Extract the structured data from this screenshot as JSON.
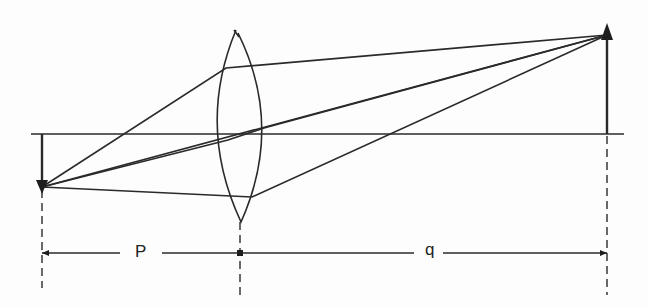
{
  "diagram": {
    "type": "thin convex lens ray diagram",
    "colors": {
      "line": "#2a2a2a",
      "background": "#fdfdfd"
    },
    "optical_axis": {
      "x1": 31,
      "x2": 624,
      "y": 134
    },
    "lens": {
      "center_x": 238,
      "top_y": 30,
      "bottom_y": 222,
      "left_x": 214,
      "right_x": 264
    },
    "object": {
      "x": 42,
      "base_y": 134,
      "tip_y": 187,
      "direction": "down"
    },
    "image": {
      "x": 607,
      "base_y": 134,
      "tip_y": 28,
      "direction": "up"
    },
    "rays": [
      {
        "name": "ray-top",
        "points": [
          [
            42,
            187
          ],
          [
            226,
            68
          ],
          [
            607,
            35
          ]
        ]
      },
      {
        "name": "ray-center",
        "points": [
          [
            42,
            187
          ],
          [
            607,
            35
          ]
        ]
      },
      {
        "name": "ray-through-axis",
        "points": [
          [
            42,
            187
          ],
          [
            264,
            128
          ],
          [
            607,
            35
          ]
        ]
      },
      {
        "name": "ray-bottom",
        "points": [
          [
            42,
            187
          ],
          [
            252,
            196
          ],
          [
            607,
            35
          ]
        ]
      }
    ],
    "dimensions": {
      "p_label": "P",
      "q_label": "q",
      "y": 253
    }
  }
}
